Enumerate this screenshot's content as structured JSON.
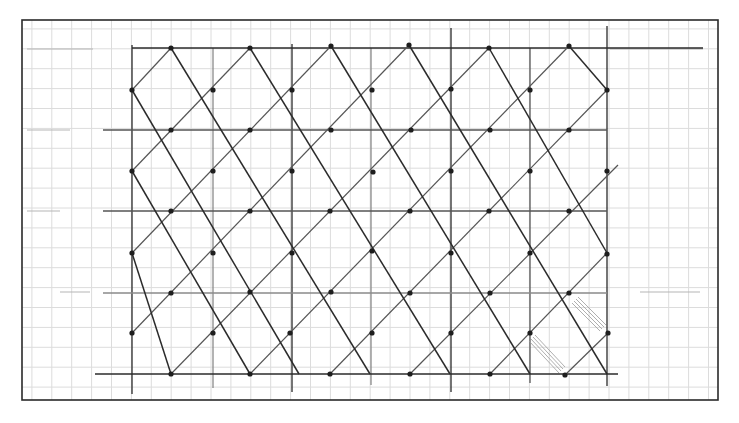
{
  "sheet": {
    "width": 739,
    "height": 423,
    "background": "#ffffff",
    "frame": {
      "x1": 22,
      "y1": 20,
      "x2": 718,
      "y2": 400,
      "color": "#2a2a2a"
    },
    "graph_paper": {
      "spacing": 19.9,
      "origin_x": 12,
      "origin_y": 9,
      "color": "#dcdcdc"
    }
  },
  "lattice": {
    "pencil_dark": "#2b2b2b",
    "pencil_mid": "#555555",
    "pencil_light": "#8a8a8a",
    "verticals": [
      {
        "x": 132,
        "y1": 45,
        "y2": 394,
        "shade": "dark"
      },
      {
        "x": 213,
        "y1": 48,
        "y2": 388,
        "shade": "light"
      },
      {
        "x": 292,
        "y1": 44,
        "y2": 392,
        "shade": "dark"
      },
      {
        "x": 371,
        "y1": 48,
        "y2": 385,
        "shade": "light"
      },
      {
        "x": 451,
        "y1": 28,
        "y2": 392,
        "shade": "dark"
      },
      {
        "x": 530,
        "y1": 48,
        "y2": 383,
        "shade": "mid"
      },
      {
        "x": 607,
        "y1": 26,
        "y2": 386,
        "shade": "dark"
      }
    ],
    "horizontals": [
      {
        "y": 48,
        "x1": 132,
        "x2": 703,
        "shade": "dark"
      },
      {
        "y": 130,
        "x1": 103,
        "x2": 607,
        "shade": "mid"
      },
      {
        "y": 211,
        "x1": 103,
        "x2": 607,
        "shade": "mid"
      },
      {
        "y": 293,
        "x1": 103,
        "x2": 607,
        "shade": "light"
      },
      {
        "y": 374,
        "x1": 95,
        "x2": 618,
        "shade": "dark"
      }
    ],
    "faint_extensions": [
      {
        "x1": 27,
        "y1": 49,
        "x2": 93,
        "y2": 49
      },
      {
        "x1": 27,
        "y1": 130,
        "x2": 70,
        "y2": 130
      },
      {
        "x1": 27,
        "y1": 211,
        "x2": 60,
        "y2": 211
      },
      {
        "x1": 60,
        "y1": 292,
        "x2": 90,
        "y2": 292
      },
      {
        "x1": 610,
        "y1": 49,
        "x2": 703,
        "y2": 49
      },
      {
        "x1": 640,
        "y1": 292,
        "x2": 700,
        "y2": 292
      }
    ],
    "diagonals_down_right": [
      {
        "x1": 171,
        "y1": 48,
        "x2": 370,
        "y2": 374
      },
      {
        "x1": 132,
        "y1": 90,
        "x2": 299,
        "y2": 374
      },
      {
        "x1": 132,
        "y1": 171,
        "x2": 250,
        "y2": 374
      },
      {
        "x1": 132,
        "y1": 253,
        "x2": 171,
        "y2": 374
      },
      {
        "x1": 250,
        "y1": 48,
        "x2": 450,
        "y2": 374
      },
      {
        "x1": 331,
        "y1": 46,
        "x2": 530,
        "y2": 374
      },
      {
        "x1": 409,
        "y1": 45,
        "x2": 607,
        "y2": 374
      },
      {
        "x1": 489,
        "y1": 48,
        "x2": 607,
        "y2": 253
      },
      {
        "x1": 569,
        "y1": 46,
        "x2": 607,
        "y2": 90
      }
    ],
    "diagonals_up_right": [
      {
        "x1": 132,
        "y1": 90,
        "x2": 171,
        "y2": 48
      },
      {
        "x1": 132,
        "y1": 171,
        "x2": 250,
        "y2": 48
      },
      {
        "x1": 132,
        "y1": 253,
        "x2": 331,
        "y2": 46
      },
      {
        "x1": 132,
        "y1": 333,
        "x2": 409,
        "y2": 45
      },
      {
        "x1": 171,
        "y1": 374,
        "x2": 489,
        "y2": 48
      },
      {
        "x1": 250,
        "y1": 374,
        "x2": 569,
        "y2": 46
      },
      {
        "x1": 330,
        "y1": 374,
        "x2": 607,
        "y2": 90
      },
      {
        "x1": 410,
        "y1": 374,
        "x2": 618,
        "y2": 165
      },
      {
        "x1": 490,
        "y1": 374,
        "x2": 607,
        "y2": 253
      },
      {
        "x1": 565,
        "y1": 375,
        "x2": 608,
        "y2": 333
      }
    ],
    "nodes": [
      [
        171,
        48
      ],
      [
        250,
        48
      ],
      [
        331,
        46
      ],
      [
        409,
        45
      ],
      [
        489,
        48
      ],
      [
        569,
        46
      ],
      [
        132,
        90
      ],
      [
        213,
        90
      ],
      [
        292,
        90
      ],
      [
        372,
        90
      ],
      [
        451,
        89
      ],
      [
        530,
        90
      ],
      [
        607,
        90
      ],
      [
        171,
        130
      ],
      [
        250,
        130
      ],
      [
        331,
        130
      ],
      [
        411,
        130
      ],
      [
        490,
        130
      ],
      [
        569,
        130
      ],
      [
        132,
        171
      ],
      [
        213,
        171
      ],
      [
        292,
        171
      ],
      [
        373,
        172
      ],
      [
        451,
        171
      ],
      [
        530,
        171
      ],
      [
        607,
        171
      ],
      [
        171,
        211
      ],
      [
        250,
        211
      ],
      [
        330,
        211
      ],
      [
        410,
        211
      ],
      [
        489,
        211
      ],
      [
        569,
        211
      ],
      [
        132,
        253
      ],
      [
        213,
        253
      ],
      [
        292,
        253
      ],
      [
        372,
        251
      ],
      [
        451,
        253
      ],
      [
        530,
        253
      ],
      [
        607,
        254
      ],
      [
        171,
        293
      ],
      [
        250,
        292
      ],
      [
        331,
        292
      ],
      [
        410,
        293
      ],
      [
        490,
        293
      ],
      [
        569,
        293
      ],
      [
        132,
        333
      ],
      [
        213,
        333
      ],
      [
        290,
        333
      ],
      [
        372,
        333
      ],
      [
        451,
        333
      ],
      [
        530,
        333
      ],
      [
        608,
        333
      ],
      [
        171,
        374
      ],
      [
        250,
        374
      ],
      [
        330,
        374
      ],
      [
        410,
        374
      ],
      [
        490,
        374
      ],
      [
        565,
        375
      ]
    ],
    "node_radius": 2.6,
    "hatch_marks": [
      {
        "x1": 532,
        "y1": 338,
        "x2": 562,
        "y2": 370
      },
      {
        "x1": 575,
        "y1": 300,
        "x2": 603,
        "y2": 328
      }
    ]
  }
}
